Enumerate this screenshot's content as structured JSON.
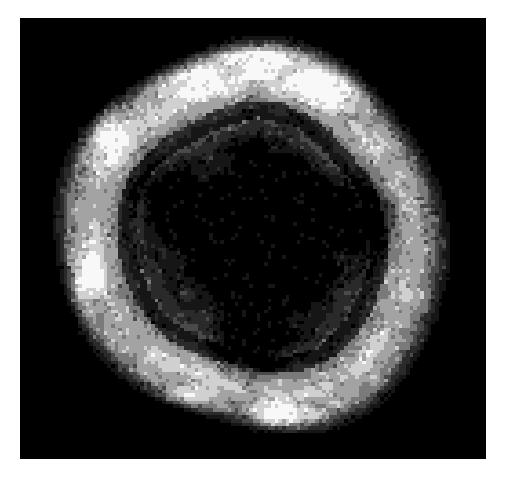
{
  "page": {
    "background_color": "#ffffff",
    "width": 507,
    "height": 478
  },
  "scan": {
    "name": "brain-scan-image",
    "modality_appearance": "grayscale posterized axial brain slice",
    "frame": {
      "x": 20,
      "y": 18,
      "width": 466,
      "height": 441,
      "background_color": "#000000"
    },
    "render": {
      "grid_columns": 128,
      "grid_rows": 121,
      "smoothing": "none"
    },
    "intensity_levels": [
      {
        "name": "background",
        "value": 0,
        "hex": "#000000"
      },
      {
        "name": "very-dark",
        "value": 22,
        "hex": "#161616"
      },
      {
        "name": "dark",
        "value": 42,
        "hex": "#2a2a2a"
      },
      {
        "name": "mid-dark",
        "value": 74,
        "hex": "#4a4a4a"
      },
      {
        "name": "mid",
        "value": 122,
        "hex": "#7a7a7a"
      },
      {
        "name": "light",
        "value": 163,
        "hex": "#a3a3a3"
      },
      {
        "name": "bright",
        "value": 208,
        "hex": "#d0d0d0"
      },
      {
        "name": "white",
        "value": 248,
        "hex": "#f8f8f8"
      }
    ],
    "head": {
      "center_x_frac": 0.5,
      "center_y_frac": 0.505,
      "radius_x_frac": 0.415,
      "radius_y_frac": 0.455
    },
    "ventricle_core": {
      "center_x_frac": 0.515,
      "center_y_frac": 0.47,
      "radius_x_frac": 0.19,
      "radius_y_frac": 0.225
    },
    "cortex_band": {
      "inner_frac": 0.62,
      "outer_frac": 1.0
    },
    "hotspots": [
      {
        "name": "anterior-left-rim",
        "cx": 0.34,
        "cy": 0.12,
        "rx": 0.16,
        "ry": 0.075,
        "intensity": 7
      },
      {
        "name": "anterior-right-rim",
        "cx": 0.66,
        "cy": 0.145,
        "rx": 0.15,
        "ry": 0.07,
        "intensity": 7
      },
      {
        "name": "anterior-vertex",
        "cx": 0.5,
        "cy": 0.09,
        "rx": 0.2,
        "ry": 0.055,
        "intensity": 6
      },
      {
        "name": "left-lateral-superior",
        "cx": 0.175,
        "cy": 0.265,
        "rx": 0.07,
        "ry": 0.1,
        "intensity": 7
      },
      {
        "name": "left-lateral-inferior",
        "cx": 0.125,
        "cy": 0.63,
        "rx": 0.055,
        "ry": 0.145,
        "intensity": 7
      },
      {
        "name": "posterior-left",
        "cx": 0.345,
        "cy": 0.885,
        "rx": 0.115,
        "ry": 0.065,
        "intensity": 7
      },
      {
        "name": "posterior-midline",
        "cx": 0.555,
        "cy": 0.915,
        "rx": 0.13,
        "ry": 0.055,
        "intensity": 7
      },
      {
        "name": "right-lateral-focus",
        "cx": 0.875,
        "cy": 0.745,
        "rx": 0.028,
        "ry": 0.055,
        "intensity": 7
      },
      {
        "name": "right-rim-dot",
        "cx": 0.895,
        "cy": 0.495,
        "rx": 0.013,
        "ry": 0.013,
        "intensity": 7
      }
    ],
    "coldspots": [
      {
        "name": "central-defect",
        "cx": 0.53,
        "cy": 0.52,
        "rx": 0.185,
        "ry": 0.21,
        "intensity": 1
      },
      {
        "name": "left-frontal-dark",
        "cx": 0.315,
        "cy": 0.42,
        "rx": 0.1,
        "ry": 0.12,
        "intensity": 2
      },
      {
        "name": "right-parietal-dark",
        "cx": 0.735,
        "cy": 0.45,
        "rx": 0.115,
        "ry": 0.14,
        "intensity": 2
      },
      {
        "name": "posterior-central-dark",
        "cx": 0.5,
        "cy": 0.73,
        "rx": 0.115,
        "ry": 0.1,
        "intensity": 2
      }
    ]
  }
}
